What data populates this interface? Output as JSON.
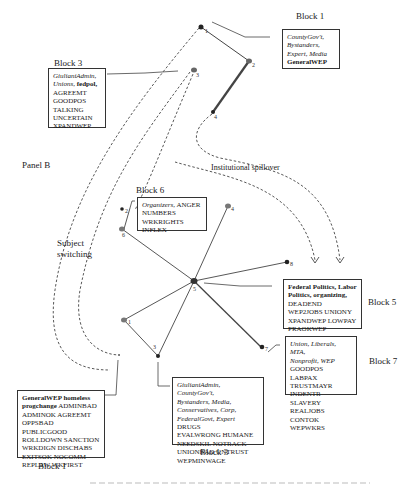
{
  "panel_label": "Panel B",
  "annotations": {
    "subject_switching_line1": "Subject",
    "subject_switching_line2": "switching",
    "institutional_spillover": "Institutional spillover"
  },
  "blocks": {
    "top_right": {
      "title": "Block 1",
      "italic_lines": [
        "CountyGov't,",
        "Bystanders,",
        "Expert, Media"
      ],
      "bold": "GeneralWEP"
    },
    "top_left": {
      "title": "Block 3",
      "italic": "GiulianiAdmin, Unions,",
      "bold": "fedpol,",
      "codes": [
        "AGREEMT",
        "GOODPOS",
        "TALKING",
        "UNCERTAIN",
        "XPANDWEP"
      ]
    },
    "block6": {
      "title": "Block 6",
      "italic": "Organizers,",
      "codes_line1": "ANGER",
      "codes": [
        "NUMBERS",
        "WRKRIGHTS",
        "INFLEX"
      ]
    },
    "block5": {
      "title": "Block 5",
      "bold_lines": [
        "Federal Politics, Labor",
        "Politics, organizing,"
      ],
      "codes": [
        "DEADEND",
        "WEP2JOBS UNIONY",
        "XPANDWEP LOWPAY",
        "PRAOKWEP"
      ]
    },
    "block7": {
      "title": "Block 7",
      "italic_lines": [
        "Union, Liberals, MTA,",
        "Nonprofit, WEP"
      ],
      "codes": [
        "GOODPOS LABPAX",
        "TRUSTMAYR",
        "INDENTR SLAVERY",
        "REALJOBS CONTOK",
        "WEPWKRS"
      ]
    },
    "bottom_left": {
      "title": "Block 1",
      "bold_lines": [
        "GeneralWEP homeless",
        "progchange"
      ],
      "codes_line1": "ADMINBAD",
      "codes": [
        "ADMINOK AGREEMT",
        "OPPSBAD PUBLICGOOD",
        "ROLLDOWN SANCTION",
        "WRKDIGN DISCHABS",
        "EXITSOK NOCOMM",
        "REPLAW WKFIRST"
      ]
    },
    "bottom_center": {
      "title": "Block 3",
      "italic_lines": [
        "GiulianiAdmin, CountyGov't,",
        "Bystanders, Media,",
        "Conservatives, Corp,"
      ],
      "italic_last": "FederalGovt, Expert",
      "codes_line1": "DRUGS",
      "codes": [
        "EVALWRONG HUMANE",
        "NEEDSKIL NOTRACK",
        "UNIONBAD UNTRUST",
        "WEPMINWAGE"
      ]
    }
  },
  "nodes": {
    "top": [
      {
        "id": "1",
        "label": "1"
      },
      {
        "id": "2",
        "label": "2"
      },
      {
        "id": "3",
        "label": "3"
      },
      {
        "id": "4",
        "label": "4"
      }
    ],
    "center": [
      {
        "id": "hub",
        "label": "5"
      },
      {
        "id": "c1",
        "label": "1"
      },
      {
        "id": "c2",
        "label": "2"
      },
      {
        "id": "c3",
        "label": "3"
      },
      {
        "id": "c4",
        "label": "4"
      },
      {
        "id": "c6",
        "label": "6"
      },
      {
        "id": "c7",
        "label": "7"
      },
      {
        "id": "c8",
        "label": "8"
      }
    ]
  },
  "caption_fragment": "Figure (partially cut off at bottom)"
}
